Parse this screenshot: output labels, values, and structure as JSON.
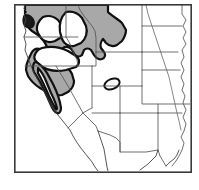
{
  "figure": {
    "kind": "species-range-map",
    "region_label": "Western United States",
    "frame": {
      "x": 14,
      "y": 4,
      "width": 177,
      "height": 168
    }
  },
  "legend": {
    "shaded_meaning": "occupied range",
    "unshaded_meaning": "unoccupied area",
    "outline_meaning": "range boundary"
  },
  "colors": {
    "range_fill": "#a8a8a8",
    "range_outline": "#101010",
    "state_border": "#555555",
    "frame": "#3a3a3a",
    "background": "#ffffff",
    "hole_fill": "#ffffff"
  },
  "map_features": {
    "primary_range": {
      "name": "main-shaded-range",
      "description": "Contiguous shaded distribution covering the Pacific Northwest, northern California coast and adjacent interior",
      "states_covered": [
        "Washington",
        "Oregon",
        "Idaho",
        "Northern California",
        "Western Montana",
        "Northwest Wyoming"
      ]
    },
    "interior_gaps": {
      "name": "unshaded-interior-gaps",
      "count": 3,
      "description": "White unoccupied inclusions within the shaded range"
    },
    "disjunct_population": {
      "name": "colorado-isolate",
      "description": "Small isolated outlined population in western Colorado",
      "approx_center": {
        "x": 112,
        "y": 84
      },
      "approx_size": {
        "width": 16,
        "height": 10
      }
    },
    "dark_spot": {
      "name": "puget-sound-dark-spot",
      "description": "Dark solid patch at the northwest coast",
      "approx_center": {
        "x": 29,
        "y": 21
      }
    },
    "hydrography": {
      "name": "missouri-river",
      "description": "River line crossing the Dakotas and Nebraska"
    }
  },
  "state_boundaries": {
    "count": 17,
    "names": [
      "Washington",
      "Oregon",
      "California",
      "Nevada",
      "Idaho",
      "Montana",
      "Wyoming",
      "Utah",
      "Arizona",
      "Colorado",
      "New Mexico",
      "North Dakota",
      "South Dakota",
      "Nebraska",
      "Kansas",
      "Oklahoma",
      "Texas"
    ]
  },
  "caption": ""
}
